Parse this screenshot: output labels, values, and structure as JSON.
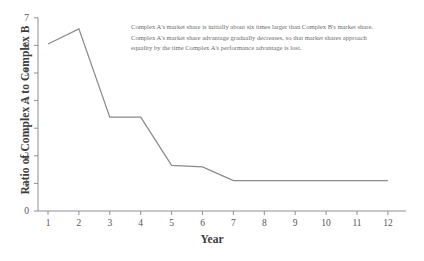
{
  "chart_data": {
    "type": "line",
    "title": "",
    "xlabel": "Year",
    "ylabel": "Ratio of Complex A to Complex B",
    "x": [
      1,
      2,
      3,
      4,
      5,
      6,
      7,
      8,
      9,
      10,
      11,
      12
    ],
    "categories": [
      "1",
      "2",
      "3",
      "4",
      "5",
      "6",
      "7",
      "8",
      "9",
      "10",
      "11",
      "12"
    ],
    "values": [
      6.05,
      6.6,
      3.4,
      3.4,
      1.65,
      1.6,
      1.1,
      1.1,
      1.1,
      1.1,
      1.1,
      1.1
    ],
    "series": [
      {
        "name": "Ratio of Complex A to Complex B",
        "values": [
          6.05,
          6.6,
          3.4,
          3.4,
          1.65,
          1.6,
          1.1,
          1.1,
          1.1,
          1.1,
          1.1,
          1.1
        ]
      }
    ],
    "xlim": [
      0,
      12.6
    ],
    "ylim": [
      0,
      7
    ],
    "xticks": [
      1,
      2,
      3,
      4,
      5,
      6,
      7,
      8,
      9,
      10,
      11,
      12
    ],
    "yticks": [
      0,
      1,
      2,
      3,
      4,
      5,
      6,
      7
    ],
    "ytick_labels": [
      "0",
      "1",
      "2",
      "3",
      "4",
      "5",
      "6",
      "7"
    ],
    "grid": false,
    "legend": false,
    "line_color": "#8a8a8a",
    "axis_color": "#8f8f8f"
  },
  "annotation": {
    "line1": "Complex A's market share is initially about six times larger than Complex B's market share.",
    "line2": "Complex A's market share advantage gradually decreases, so that market shares approach",
    "line3": "equality by the time Complex A's performance advantage is lost."
  }
}
